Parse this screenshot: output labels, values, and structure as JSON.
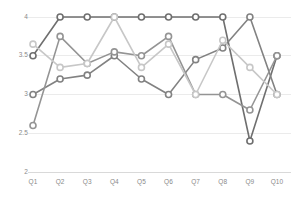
{
  "chart_data": {
    "type": "line",
    "title": "",
    "subtitle": "",
    "xlabel": "",
    "ylabel": "",
    "categories": [
      "Q1",
      "Q2",
      "Q3",
      "Q4",
      "Q5",
      "Q6",
      "Q7",
      "Q8",
      "Q9",
      "Q10"
    ],
    "ylim": [
      2,
      4
    ],
    "yticks": [
      2,
      2.5,
      3,
      3.5,
      4
    ],
    "ytick_labels": [
      "2",
      "2.5",
      "3",
      "3.5",
      "4"
    ],
    "grid": true,
    "grid_axis": "y",
    "legend": false,
    "legend_position": "none",
    "markers": "open-circle",
    "series": [
      {
        "name": "Series 1",
        "color": "#6f6f6f",
        "values": [
          3.5,
          4,
          4,
          4,
          4,
          4,
          4,
          4,
          2.4,
          3.5
        ]
      },
      {
        "name": "Series 2",
        "color": "#828282",
        "values": [
          3.0,
          3.2,
          3.25,
          3.5,
          3.2,
          3.0,
          3.45,
          3.6,
          4.0,
          3.0
        ]
      },
      {
        "name": "Series 3",
        "color": "#949494",
        "values": [
          2.6,
          3.75,
          3.4,
          3.55,
          3.5,
          3.75,
          3.0,
          3.0,
          2.8,
          3.5
        ]
      },
      {
        "name": "Series 4",
        "color": "#c7c7c7",
        "values": [
          3.65,
          3.35,
          3.4,
          4.0,
          3.35,
          3.65,
          3.0,
          3.7,
          3.35,
          3.0
        ]
      }
    ],
    "axis_color": "#d9d9d9",
    "grid_color": "#ebebeb",
    "tick_label_color": "#8a8a8a",
    "background": "#ffffff"
  }
}
